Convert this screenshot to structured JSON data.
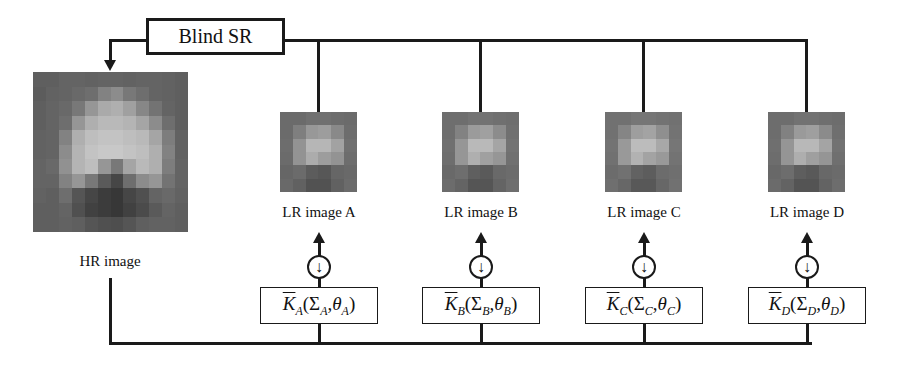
{
  "diagram": {
    "title_box": "Blind SR",
    "hr_image": {
      "label": "HR image"
    },
    "branches": [
      {
        "id": "A",
        "label": "LR image A",
        "kernel": {
          "symbol": "K",
          "sub": "A",
          "sigma": "Σ",
          "theta": "θ"
        },
        "downsample": "↓"
      },
      {
        "id": "B",
        "label": "LR image B",
        "kernel": {
          "symbol": "K",
          "sub": "B",
          "sigma": "Σ",
          "theta": "θ"
        },
        "downsample": "↓"
      },
      {
        "id": "C",
        "label": "LR image C",
        "kernel": {
          "symbol": "K",
          "sub": "C",
          "sigma": "Σ",
          "theta": "θ"
        },
        "downsample": "↓"
      },
      {
        "id": "D",
        "label": "LR image D",
        "kernel": {
          "symbol": "K",
          "sub": "D",
          "sigma": "Σ",
          "theta": "θ"
        },
        "downsample": "↓"
      }
    ],
    "colors": {
      "line": "#1a1a1a",
      "background": "#ffffff"
    }
  }
}
